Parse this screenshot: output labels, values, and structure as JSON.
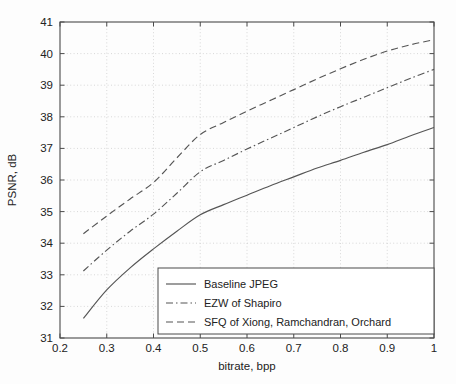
{
  "chart_data": {
    "type": "line",
    "title": "",
    "xlabel": "bitrate, bpp",
    "ylabel": "PSNR, dB",
    "xlim": [
      0.2,
      1.0
    ],
    "ylim": [
      31,
      41
    ],
    "xticks": [
      "0.2",
      "0.3",
      "0.4",
      "0.5",
      "0.6",
      "0.7",
      "0.8",
      "0.9",
      "1"
    ],
    "xtick_values": [
      0.2,
      0.3,
      0.4,
      0.5,
      0.6,
      0.7,
      0.8,
      0.9,
      1.0
    ],
    "yticks": [
      "31",
      "32",
      "33",
      "34",
      "35",
      "36",
      "37",
      "38",
      "39",
      "40",
      "41"
    ],
    "ytick_values": [
      31,
      32,
      33,
      34,
      35,
      36,
      37,
      38,
      39,
      40,
      41
    ],
    "grid": true,
    "grid_style": "dotted",
    "legend_position": "lower-right-inside",
    "series": [
      {
        "name": "Baseline JPEG",
        "style": "solid",
        "color": "#555555",
        "x": [
          0.25,
          0.3,
          0.35,
          0.4,
          0.45,
          0.5,
          0.55,
          0.6,
          0.65,
          0.7,
          0.75,
          0.8,
          0.85,
          0.9,
          0.95,
          1.0
        ],
        "y": [
          31.62,
          32.52,
          33.22,
          33.82,
          34.38,
          34.9,
          35.22,
          35.52,
          35.82,
          36.1,
          36.38,
          36.62,
          36.88,
          37.12,
          37.4,
          37.66
        ]
      },
      {
        "name": "EZW of Shapiro",
        "style": "dashdot",
        "color": "#555555",
        "x": [
          0.25,
          0.3,
          0.35,
          0.4,
          0.45,
          0.5,
          0.55,
          0.6,
          0.65,
          0.7,
          0.75,
          0.8,
          0.85,
          0.9,
          0.95,
          1.0
        ],
        "y": [
          33.12,
          33.78,
          34.38,
          34.92,
          35.58,
          36.26,
          36.62,
          36.98,
          37.32,
          37.66,
          38.0,
          38.32,
          38.62,
          38.92,
          39.22,
          39.5
        ]
      },
      {
        "name": "SFQ of Xiong, Ramchandran, Orchard",
        "style": "dashed",
        "color": "#555555",
        "x": [
          0.25,
          0.3,
          0.35,
          0.4,
          0.45,
          0.5,
          0.55,
          0.6,
          0.65,
          0.7,
          0.75,
          0.8,
          0.85,
          0.9,
          0.95,
          1.0
        ],
        "y": [
          34.3,
          34.86,
          35.4,
          35.92,
          36.7,
          37.44,
          37.82,
          38.18,
          38.52,
          38.86,
          39.2,
          39.52,
          39.82,
          40.08,
          40.28,
          40.44
        ]
      }
    ],
    "legend_entries": [
      {
        "label": "Baseline JPEG",
        "style": "solid"
      },
      {
        "label": "EZW of Shapiro",
        "style": "dashdot"
      },
      {
        "label": "SFQ of Xiong, Ramchandran, Orchard",
        "style": "dashed"
      }
    ]
  },
  "colors": {
    "axis": "#4a4a4a",
    "grid": "#c8c8c8",
    "line": "#555555",
    "background": "#fdfdfd",
    "text": "#222222"
  }
}
